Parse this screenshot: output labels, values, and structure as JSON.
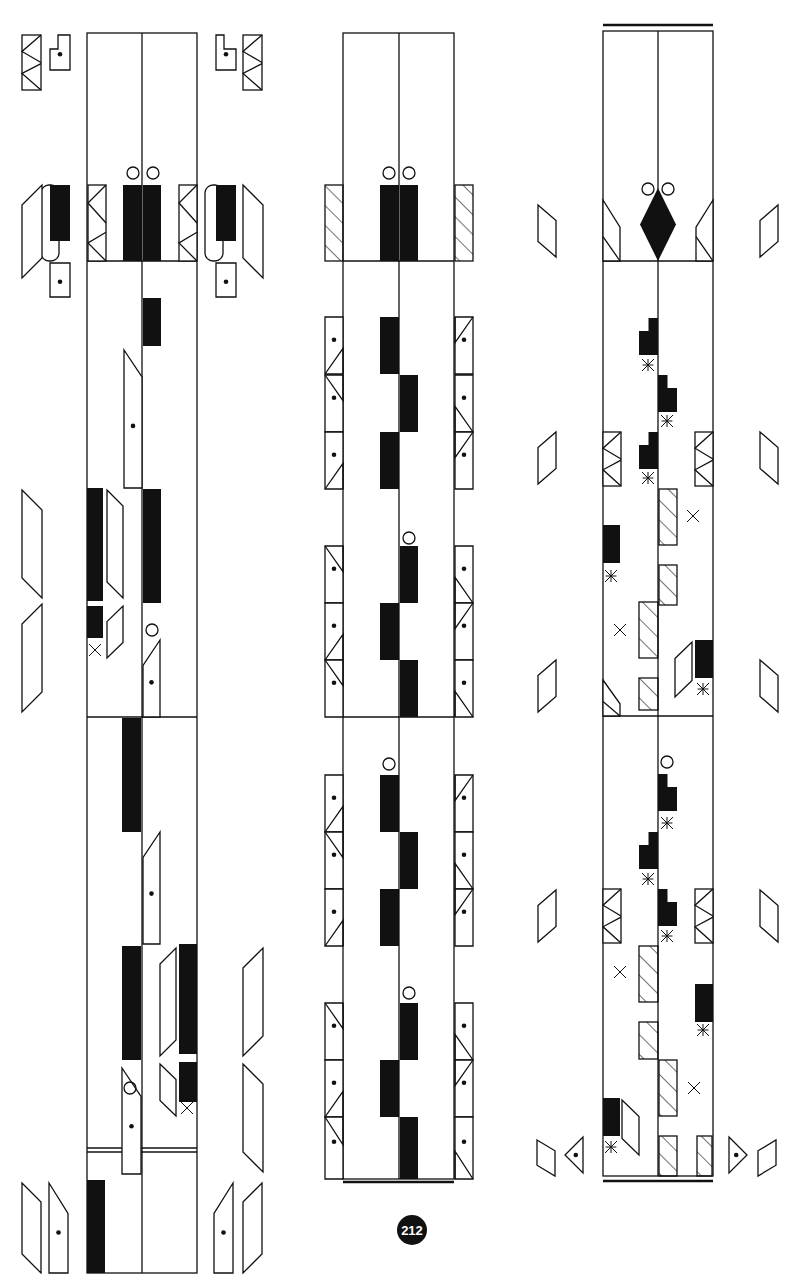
{
  "page": {
    "number": "212",
    "number_pos": [
      412,
      1230
    ],
    "ink": "#111111",
    "paper": "#ffffff"
  },
  "panels": [
    {
      "id": "left",
      "frame": {
        "x": 87,
        "y": 33,
        "w": 110,
        "h": 1240
      },
      "center_x": 142,
      "dividers": [
        261,
        717
      ],
      "bottom_double": [
        1148,
        1152
      ],
      "top_rule": null,
      "bottom_rule": null
    },
    {
      "id": "middle",
      "frame": {
        "x": 343,
        "y": 33,
        "w": 111,
        "h": 1146
      },
      "center_x": 399,
      "dividers": [
        261,
        717
      ],
      "bottom_double": null,
      "top_rule": null,
      "bottom_rule": 1182
    },
    {
      "id": "right",
      "frame": {
        "x": 603,
        "y": 31,
        "w": 110,
        "h": 1145
      },
      "center_x": 658,
      "dividers": [
        261,
        716
      ],
      "bottom_double": null,
      "top_rule": 25,
      "bottom_rule": 1181
    }
  ],
  "shapes": {
    "solid": [
      [
        123,
        185,
        19,
        76
      ],
      [
        143,
        185,
        18,
        76
      ],
      [
        143,
        298,
        18,
        48
      ],
      [
        143,
        489,
        18,
        114
      ],
      [
        87,
        488,
        16,
        113
      ],
      [
        87,
        606,
        16,
        32
      ],
      [
        122,
        718,
        19,
        114
      ],
      [
        122,
        946,
        19,
        114
      ],
      [
        179,
        944,
        18,
        110
      ],
      [
        179,
        1062,
        18,
        40
      ],
      [
        87,
        1180,
        18,
        93
      ],
      [
        50,
        185,
        20,
        56
      ],
      [
        216,
        185,
        20,
        56
      ],
      [
        380,
        185,
        19,
        76
      ],
      [
        400,
        185,
        18,
        76
      ],
      [
        380,
        317,
        19,
        57
      ],
      [
        400,
        375,
        18,
        57
      ],
      [
        380,
        432,
        19,
        57
      ],
      [
        400,
        546,
        18,
        57
      ],
      [
        380,
        603,
        19,
        57
      ],
      [
        400,
        660,
        18,
        57
      ],
      [
        380,
        775,
        19,
        57
      ],
      [
        400,
        832,
        18,
        57
      ],
      [
        380,
        889,
        19,
        57
      ],
      [
        400,
        1003,
        18,
        57
      ],
      [
        380,
        1060,
        19,
        57
      ],
      [
        400,
        1117,
        18,
        62
      ],
      [
        603,
        525,
        17,
        38
      ],
      [
        695,
        640,
        18,
        38
      ],
      [
        603,
        1098,
        17,
        38
      ],
      [
        695,
        984,
        18,
        38
      ]
    ],
    "stepped": [
      [
        639,
        318,
        19,
        37,
        "left"
      ],
      [
        658,
        375,
        19,
        37,
        "right"
      ],
      [
        639,
        432,
        19,
        37,
        "left"
      ],
      [
        658,
        774,
        19,
        37,
        "right"
      ],
      [
        639,
        832,
        19,
        37,
        "left"
      ],
      [
        658,
        889,
        19,
        37,
        "right"
      ]
    ],
    "diamond": [
      [
        658,
        188,
        18,
        73
      ]
    ],
    "hatched": [
      [
        325,
        185,
        18,
        76
      ],
      [
        455,
        185,
        18,
        76
      ],
      [
        659,
        489,
        18,
        56
      ],
      [
        659,
        565,
        18,
        40
      ],
      [
        639,
        602,
        19,
        56
      ],
      [
        639,
        678,
        19,
        32
      ],
      [
        639,
        946,
        19,
        56
      ],
      [
        639,
        1022,
        19,
        37
      ],
      [
        659,
        1060,
        18,
        56
      ],
      [
        659,
        1136,
        18,
        40
      ],
      [
        697,
        1136,
        15,
        40
      ]
    ],
    "circles": [
      [
        133,
        173,
        6
      ],
      [
        153,
        173,
        6
      ],
      [
        389,
        173,
        6
      ],
      [
        409,
        173,
        6
      ],
      [
        648,
        189,
        6
      ],
      [
        668,
        189,
        6
      ],
      [
        152,
        630,
        6
      ],
      [
        409,
        538,
        6
      ],
      [
        389,
        764,
        6
      ],
      [
        409,
        993,
        6
      ],
      [
        130,
        1088,
        6
      ],
      [
        667,
        762,
        6
      ]
    ],
    "crosses": [
      [
        95,
        650,
        6
      ],
      [
        187,
        1108,
        6
      ],
      [
        225,
        227,
        6
      ],
      [
        60,
        227,
        6
      ],
      [
        693,
        516,
        6
      ],
      [
        620,
        630,
        6
      ],
      [
        620,
        972,
        6
      ],
      [
        694,
        1088,
        6
      ]
    ],
    "asterisks": [
      [
        648,
        365,
        6
      ],
      [
        667,
        421,
        6
      ],
      [
        648,
        478,
        6
      ],
      [
        611,
        576,
        6
      ],
      [
        703,
        689,
        6
      ],
      [
        667,
        823,
        6
      ],
      [
        648,
        879,
        6
      ],
      [
        667,
        936,
        6
      ],
      [
        703,
        1030,
        6
      ],
      [
        611,
        1147,
        6
      ]
    ],
    "dot_boxes": [
      [
        50,
        35,
        20,
        35,
        "notch-tr"
      ],
      [
        216,
        35,
        20,
        35,
        "notch-tl"
      ],
      [
        50,
        263,
        20,
        34,
        "plain"
      ],
      [
        216,
        263,
        20,
        34,
        "plain"
      ],
      [
        124,
        350,
        18,
        138,
        "cut-tl"
      ],
      [
        143,
        640,
        17,
        77,
        "cut-tr"
      ],
      [
        143,
        832,
        17,
        112,
        "cut-tr"
      ],
      [
        122,
        1068,
        19,
        106,
        "cut-tl"
      ],
      [
        49,
        1183,
        19,
        90,
        "cut-tr-rev"
      ],
      [
        214,
        1183,
        19,
        90,
        "cut-tl-rev"
      ],
      [
        325,
        317,
        18,
        57,
        "tri-bl"
      ],
      [
        325,
        375,
        18,
        57,
        "tri-tl"
      ],
      [
        325,
        432,
        18,
        57,
        "tri-bl"
      ],
      [
        325,
        546,
        18,
        57,
        "tri-tl"
      ],
      [
        325,
        603,
        18,
        57,
        "tri-bl"
      ],
      [
        325,
        660,
        18,
        57,
        "tri-tl"
      ],
      [
        325,
        775,
        18,
        57,
        "tri-bl"
      ],
      [
        325,
        832,
        18,
        57,
        "tri-tl"
      ],
      [
        325,
        889,
        18,
        57,
        "tri-bl"
      ],
      [
        325,
        1003,
        18,
        57,
        "tri-tl"
      ],
      [
        325,
        1060,
        18,
        57,
        "tri-bl"
      ],
      [
        325,
        1117,
        18,
        62,
        "tri-tl"
      ],
      [
        455,
        317,
        18,
        57,
        "tri-tr"
      ],
      [
        455,
        375,
        18,
        57,
        "tri-br"
      ],
      [
        455,
        432,
        18,
        57,
        "tri-tr"
      ],
      [
        455,
        546,
        18,
        57,
        "tri-br"
      ],
      [
        455,
        603,
        18,
        57,
        "tri-tr"
      ],
      [
        455,
        660,
        18,
        57,
        "tri-br"
      ],
      [
        455,
        775,
        18,
        57,
        "tri-tr"
      ],
      [
        455,
        832,
        18,
        57,
        "tri-br"
      ],
      [
        455,
        889,
        18,
        57,
        "tri-tr"
      ],
      [
        455,
        1003,
        18,
        57,
        "tri-br"
      ],
      [
        455,
        1060,
        18,
        57,
        "tri-tr"
      ],
      [
        455,
        1117,
        18,
        62,
        "tri-br"
      ]
    ],
    "bowties": [
      [
        22,
        35,
        19,
        55
      ],
      [
        243,
        35,
        19,
        55
      ],
      [
        88,
        185,
        18,
        76
      ],
      [
        179,
        185,
        18,
        76
      ],
      [
        603,
        432,
        18,
        54
      ],
      [
        695,
        432,
        18,
        54
      ],
      [
        603,
        889,
        18,
        54
      ],
      [
        695,
        889,
        18,
        54
      ]
    ],
    "parallelograms": [
      [
        22,
        185,
        20,
        93,
        "up"
      ],
      [
        243,
        185,
        20,
        93,
        "down"
      ],
      [
        22,
        490,
        20,
        108,
        "down"
      ],
      [
        22,
        604,
        20,
        108,
        "up"
      ],
      [
        107,
        490,
        16,
        108,
        "down"
      ],
      [
        107,
        606,
        16,
        52,
        "up"
      ],
      [
        160,
        948,
        16,
        108,
        "up"
      ],
      [
        160,
        1064,
        16,
        52,
        "down"
      ],
      [
        243,
        948,
        20,
        108,
        "up"
      ],
      [
        243,
        1064,
        20,
        108,
        "down"
      ],
      [
        22,
        1183,
        19,
        90,
        "down"
      ],
      [
        243,
        1183,
        19,
        90,
        "up"
      ],
      [
        538,
        205,
        18,
        52,
        "down"
      ],
      [
        760,
        205,
        18,
        52,
        "up"
      ],
      [
        538,
        432,
        18,
        52,
        "up"
      ],
      [
        760,
        432,
        18,
        52,
        "down"
      ],
      [
        538,
        660,
        18,
        52,
        "up"
      ],
      [
        760,
        660,
        18,
        52,
        "down"
      ],
      [
        538,
        890,
        18,
        52,
        "up"
      ],
      [
        760,
        890,
        18,
        52,
        "down"
      ],
      [
        675,
        642,
        17,
        55,
        "up"
      ],
      [
        622,
        1100,
        17,
        55,
        "down"
      ],
      [
        537,
        1140,
        18,
        36,
        "down"
      ],
      [
        758,
        1140,
        18,
        36,
        "up"
      ]
    ],
    "corner_wedges": [
      [
        603,
        200,
        17,
        61,
        "tl"
      ],
      [
        696,
        200,
        17,
        61,
        "tr"
      ],
      [
        603,
        680,
        17,
        36,
        "bl"
      ]
    ],
    "triangle_dots": [
      [
        565,
        1137,
        18,
        36,
        "left"
      ],
      [
        729,
        1137,
        18,
        36,
        "right"
      ]
    ],
    "tabs_outline": [
      [
        41,
        185,
        18,
        76
      ],
      [
        205,
        185,
        18,
        76
      ]
    ],
    "rules": [
      [
        603,
        25,
        713,
        25
      ],
      [
        343,
        1182,
        454,
        1182
      ],
      [
        603,
        1181,
        713,
        1181
      ]
    ]
  }
}
